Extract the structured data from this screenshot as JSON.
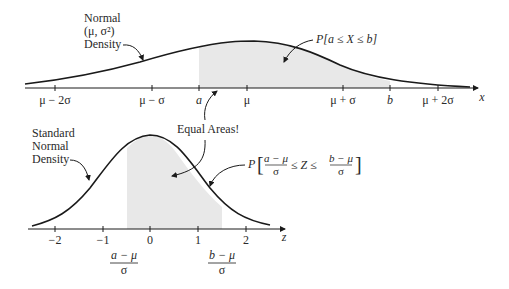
{
  "top_plot": {
    "label_line1": "Normal",
    "label_line2": "(μ, σ²)",
    "label_line3": "Density",
    "probability_label": "P[a ≤ X ≤ b]",
    "axis_variable": "x",
    "ticks": [
      "μ − 2σ",
      "μ − σ",
      "a",
      "μ",
      "μ + σ",
      "b",
      "μ + 2σ"
    ]
  },
  "bottom_plot": {
    "label_line1": "Standard",
    "label_line2": "Normal",
    "label_line3": "Density",
    "probability_prefix": "P",
    "prob_frac1_num": "a − μ",
    "prob_frac1_den": "σ",
    "prob_mid": "≤ Z ≤",
    "prob_frac2_num": "b − μ",
    "prob_frac2_den": "σ",
    "axis_variable": "z",
    "ticks": [
      "−2",
      "−1",
      "0",
      "1",
      "2"
    ],
    "frac_a_num": "a − μ",
    "frac_a_den": "σ",
    "frac_b_num": "b − μ",
    "frac_b_den": "σ"
  },
  "annotation": "Equal Areas!",
  "colors": {
    "curve": "#1a1a1a",
    "shade": "#e8e8e8",
    "text": "#2a2a2a"
  }
}
